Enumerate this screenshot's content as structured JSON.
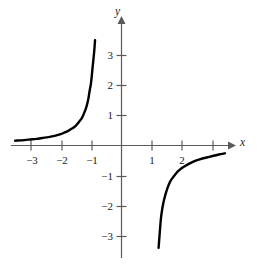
{
  "figure": {
    "background_color": "#ffffff",
    "curve_color": "#000000",
    "axis_color": "#555555",
    "text_color": "#1a1a1a"
  },
  "chart_data": {
    "type": "line",
    "title": "",
    "subtitle": "",
    "xlabel": "x",
    "ylabel": "y",
    "grid": false,
    "legend": null,
    "annotations": [],
    "xlim": [
      -3.5,
      3.5
    ],
    "ylim": [
      -3.6,
      3.6
    ],
    "x_ticks": [
      -3,
      -2,
      -1,
      1,
      2,
      3
    ],
    "x_tick_labels": [
      "−3",
      "−2",
      "−1",
      "1",
      "2",
      ""
    ],
    "y_ticks": [
      3,
      2,
      1,
      -1,
      -2,
      -3
    ],
    "y_tick_labels": [
      "3",
      "2",
      "1",
      "−1",
      "−2",
      "−3"
    ],
    "series": [
      {
        "name": "left-branch",
        "x": [
          -3.5,
          -3.2,
          -3.0,
          -2.8,
          -2.6,
          -2.4,
          -2.2,
          -2.0,
          -1.9,
          -1.8,
          -1.7,
          -1.6,
          -1.5,
          -1.4,
          -1.3,
          -1.2,
          -1.15,
          -1.1,
          -1.05,
          -1.0,
          -0.95,
          -0.9,
          -0.87
        ],
        "y": [
          0.16,
          0.18,
          0.2,
          0.22,
          0.25,
          0.28,
          0.32,
          0.38,
          0.42,
          0.46,
          0.52,
          0.58,
          0.66,
          0.78,
          0.92,
          1.15,
          1.3,
          1.5,
          1.8,
          2.1,
          2.6,
          3.1,
          3.5
        ]
      },
      {
        "name": "right-branch",
        "x": [
          1.22,
          1.25,
          1.3,
          1.35,
          1.4,
          1.5,
          1.6,
          1.7,
          1.8,
          1.9,
          2.0,
          2.2,
          2.4,
          2.6,
          2.8,
          3.0,
          3.2,
          3.4
        ],
        "y": [
          -3.4,
          -3.0,
          -2.4,
          -2.05,
          -1.8,
          -1.45,
          -1.2,
          -1.05,
          -0.92,
          -0.82,
          -0.74,
          -0.62,
          -0.52,
          -0.45,
          -0.4,
          -0.35,
          -0.3,
          -0.26
        ]
      }
    ]
  },
  "axes": {
    "x_axis_name": "x-axis",
    "y_axis_name": "y-axis",
    "x_label": "x",
    "y_label": "y"
  },
  "labels": {
    "y3": "3",
    "y2": "2",
    "y1": "1",
    "ym1": "−1",
    "ym2": "−2",
    "ym3": "−3",
    "xm3": "−3",
    "xm2": "−2",
    "xm1": "−1",
    "x1": "1",
    "x2": "2"
  }
}
